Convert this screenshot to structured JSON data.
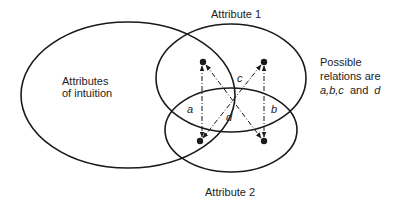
{
  "diagram": {
    "sets": {
      "intuition": "Attributes of intuition",
      "intuition_line1": "Attributes",
      "intuition_line2": "of intuition",
      "attribute1": "Attribute 1",
      "attribute2": "Attribute 2"
    },
    "relations": {
      "a": "a",
      "b": "b",
      "c": "c",
      "d": "d"
    },
    "note": {
      "line1": "Possible",
      "line2": "relations are",
      "line3_list": "a,b,c",
      "line3_and": "and",
      "line3_last": "d"
    },
    "colors": {
      "ink": "#1a1a1a",
      "background": "#ffffff"
    }
  }
}
